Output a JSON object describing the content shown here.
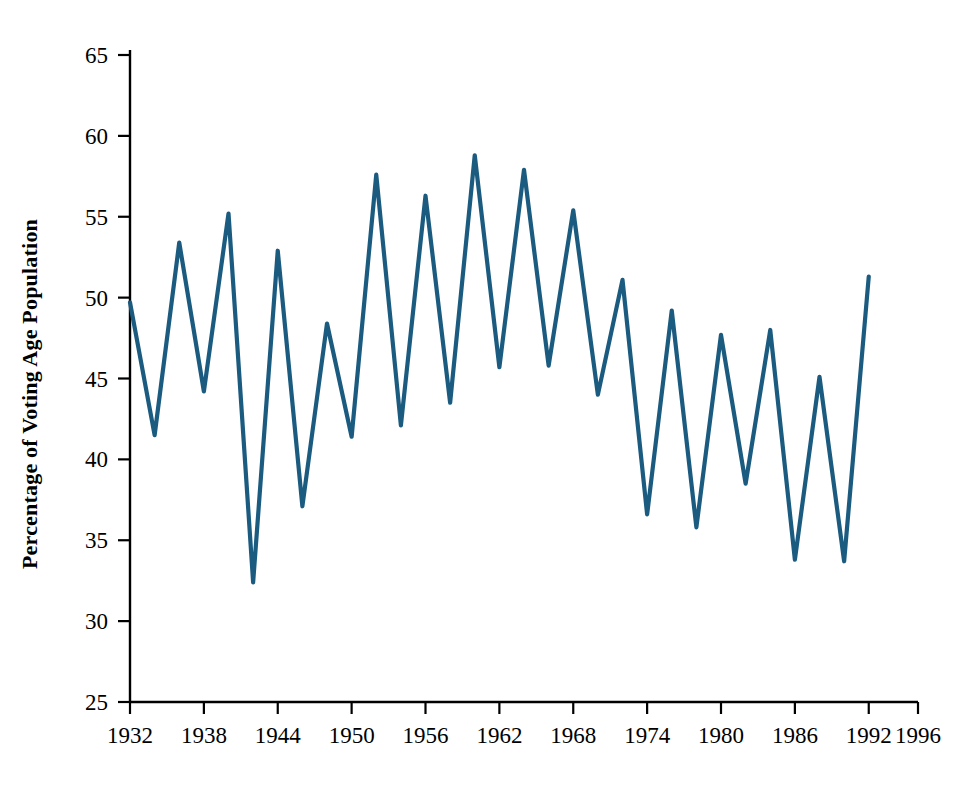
{
  "chart_data": {
    "type": "line",
    "title": "",
    "subtitle": "",
    "xlabel": "",
    "ylabel": "Percentage of Voting Age Population",
    "xlim": [
      1932,
      1996
    ],
    "ylim": [
      25,
      65
    ],
    "xticks": [
      1932,
      1938,
      1944,
      1950,
      1956,
      1962,
      1968,
      1974,
      1980,
      1986,
      1992,
      1996
    ],
    "yticks": [
      25,
      30,
      35,
      40,
      45,
      50,
      55,
      60,
      65
    ],
    "grid": false,
    "legend": null,
    "series": [
      {
        "name": "Voter Turnout",
        "color": "#1b5b80",
        "x": [
          1932,
          1934,
          1936,
          1938,
          1940,
          1942,
          1944,
          1946,
          1948,
          1950,
          1952,
          1954,
          1956,
          1958,
          1960,
          1962,
          1964,
          1966,
          1968,
          1970,
          1972,
          1974,
          1976,
          1978,
          1980,
          1982,
          1984,
          1986,
          1988,
          1990,
          1992
        ],
        "values": [
          49.7,
          41.5,
          53.4,
          44.2,
          55.2,
          32.4,
          52.9,
          37.1,
          48.4,
          41.4,
          57.6,
          42.1,
          56.3,
          43.5,
          58.8,
          45.7,
          57.9,
          45.8,
          55.4,
          44.0,
          51.1,
          36.6,
          49.2,
          35.8,
          47.7,
          38.5,
          48.0,
          33.8,
          45.1,
          33.7,
          51.3
        ]
      }
    ],
    "annotations": []
  },
  "axis": {
    "y_tick_labels": [
      "65",
      "60",
      "55",
      "50",
      "45",
      "40",
      "35",
      "30",
      "25"
    ],
    "x_tick_labels": [
      "1932",
      "1938",
      "1944",
      "1950",
      "1956",
      "1962",
      "1968",
      "1974",
      "1980",
      "1986",
      "1992",
      "1996"
    ]
  },
  "style": {
    "line_color": "#1b5b80",
    "axis_color": "#000000",
    "background": "#ffffff"
  }
}
